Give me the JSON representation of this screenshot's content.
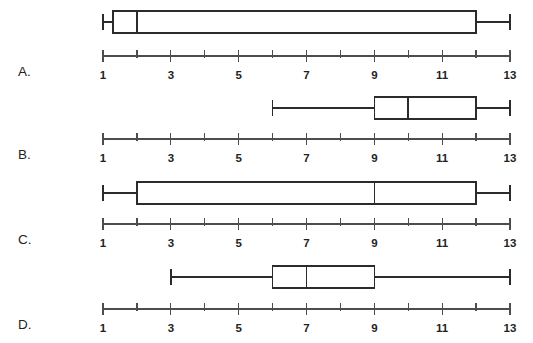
{
  "figure": {
    "title": "",
    "width": 533,
    "height": 343,
    "background_color": "#ffffff",
    "line_color": "#2b2b2b",
    "axis_color": "#4d4d4d",
    "box_fill_color": "#ffffff"
  },
  "chart_data": {
    "type": "boxplot",
    "title": "",
    "xlabel": "",
    "ylabel": "",
    "xlim": [
      1,
      13
    ],
    "grid": false,
    "legend": null,
    "tick_step": 1,
    "ticks": [
      1,
      2,
      3,
      4,
      5,
      6,
      7,
      8,
      9,
      10,
      11,
      12,
      13
    ],
    "tick_labels": [
      "1",
      "",
      "3",
      "",
      "5",
      "",
      "7",
      "",
      "9",
      "",
      "11",
      "",
      "13"
    ],
    "labeled_ticks": [
      1,
      3,
      5,
      7,
      9,
      11,
      13
    ],
    "panels": [
      {
        "label": "A.",
        "name": "boxplot-a",
        "min": 1,
        "q1": 1.3,
        "median": 2,
        "q3": 12,
        "max": 13
      },
      {
        "label": "B.",
        "name": "boxplot-b",
        "min": 6,
        "q1": 9,
        "median": 10,
        "q3": 12,
        "max": 13
      },
      {
        "label": "C.",
        "name": "boxplot-c",
        "min": 1,
        "q1": 2,
        "median": 9,
        "q3": 12,
        "max": 13
      },
      {
        "label": "D.",
        "name": "boxplot-d",
        "min": 3,
        "q1": 6,
        "median": 7,
        "q3": 9,
        "max": 13
      }
    ]
  },
  "layout": {
    "axis_x_start": 103,
    "axis_x_end": 510,
    "panel_rows": [
      {
        "box_y": 22,
        "axis_y": 56,
        "label_y": 76,
        "tick_label_y": 79
      },
      {
        "box_y": 108,
        "axis_y": 139,
        "label_y": 159,
        "tick_label_y": 162
      },
      {
        "box_y": 193,
        "axis_y": 224,
        "label_y": 244,
        "tick_label_y": 247
      },
      {
        "box_y": 277,
        "axis_y": 309,
        "label_y": 329,
        "tick_label_y": 332
      }
    ],
    "box_half_height": 11,
    "cap_half_height": 8,
    "tick_length": 6,
    "label_x": 18
  }
}
